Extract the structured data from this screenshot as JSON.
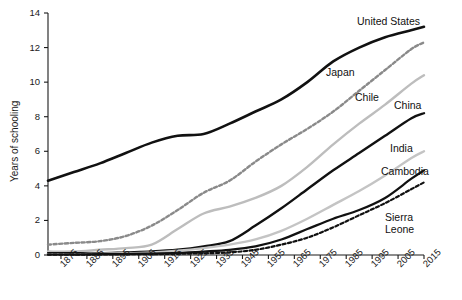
{
  "chart_data": {
    "type": "line",
    "title": "",
    "xlabel": "",
    "ylabel": "Years of schooling",
    "xlim": [
      1870,
      2015
    ],
    "ylim": [
      0,
      14
    ],
    "y_ticks": [
      0,
      2,
      4,
      6,
      8,
      10,
      12,
      14
    ],
    "x_ticks": [
      1875,
      1885,
      1895,
      1905,
      1915,
      1925,
      1935,
      1945,
      1955,
      1965,
      1975,
      1985,
      1995,
      2005,
      2015
    ],
    "x_tick_labels": [
      "1875",
      "1885",
      "1895",
      "1905",
      "1915",
      "1925",
      "1935",
      "1945",
      "1955",
      "1965",
      "1975",
      "1985",
      "1995",
      "2005",
      "2015"
    ],
    "y_tick_labels": [
      "0",
      "2",
      "4",
      "6",
      "8",
      "10",
      "12",
      "14"
    ],
    "grid": false,
    "legend": "inline-right-labels",
    "x": [
      1870,
      1880,
      1890,
      1900,
      1910,
      1920,
      1930,
      1940,
      1950,
      1960,
      1970,
      1980,
      1990,
      2000,
      2010,
      2015
    ],
    "series": [
      {
        "name": "United States",
        "color": "#111111",
        "style": "solid",
        "width": 2.6,
        "values": [
          4.3,
          4.8,
          5.3,
          5.9,
          6.5,
          6.9,
          7.0,
          7.6,
          8.3,
          9.0,
          10.0,
          11.2,
          12.0,
          12.6,
          13.0,
          13.2
        ]
      },
      {
        "name": "Japan",
        "color": "#8a8a8a",
        "style": "dashed",
        "width": 2.4,
        "values": [
          0.6,
          0.7,
          0.8,
          1.1,
          1.7,
          2.6,
          3.6,
          4.3,
          5.4,
          6.4,
          7.3,
          8.3,
          9.5,
          10.7,
          11.9,
          12.3
        ]
      },
      {
        "name": "Chile",
        "color": "#bdbdbd",
        "style": "solid",
        "width": 2.4,
        "values": [
          0.2,
          0.2,
          0.3,
          0.4,
          0.6,
          1.5,
          2.4,
          2.8,
          3.3,
          4.0,
          5.1,
          6.4,
          7.6,
          8.7,
          9.9,
          10.4
        ]
      },
      {
        "name": "China",
        "color": "#111111",
        "style": "solid",
        "width": 2.4,
        "values": [
          0.1,
          0.1,
          0.1,
          0.15,
          0.2,
          0.3,
          0.5,
          0.8,
          1.7,
          2.7,
          3.8,
          4.9,
          5.9,
          6.9,
          7.9,
          8.2
        ]
      },
      {
        "name": "India",
        "color": "#c4c4c4",
        "style": "solid",
        "width": 2.4,
        "values": [
          0.05,
          0.05,
          0.08,
          0.1,
          0.15,
          0.25,
          0.4,
          0.6,
          0.9,
          1.4,
          2.1,
          2.9,
          3.7,
          4.6,
          5.6,
          6.0
        ]
      },
      {
        "name": "Cambodia",
        "color": "#111111",
        "style": "solid",
        "width": 2.2,
        "values": [
          0.03,
          0.03,
          0.05,
          0.06,
          0.08,
          0.12,
          0.2,
          0.3,
          0.5,
          0.9,
          1.5,
          2.1,
          2.6,
          3.3,
          4.4,
          4.9
        ]
      },
      {
        "name": "Sierra Leone",
        "color": "#111111",
        "style": "dashed",
        "width": 2.2,
        "values": [
          0.02,
          0.02,
          0.03,
          0.04,
          0.05,
          0.07,
          0.1,
          0.15,
          0.3,
          0.6,
          1.0,
          1.6,
          2.3,
          3.0,
          3.8,
          4.2
        ]
      }
    ],
    "annotations": [
      {
        "text": "United States",
        "series": "United States",
        "x_px": 357,
        "y_px": 16
      },
      {
        "text": "Japan",
        "series": "Japan",
        "x_px": 326,
        "y_px": 67
      },
      {
        "text": "Chile",
        "series": "Chile",
        "x_px": 355,
        "y_px": 92
      },
      {
        "text": "China",
        "series": "China",
        "x_px": 394,
        "y_px": 100
      },
      {
        "text": "India",
        "series": "India",
        "x_px": 390,
        "y_px": 143
      },
      {
        "text": "Cambodia",
        "series": "Cambodia",
        "x_px": 381,
        "y_px": 166
      },
      {
        "text": "Sierra\nLeone",
        "series": "Sierra Leone",
        "x_px": 385,
        "y_px": 212
      }
    ]
  }
}
